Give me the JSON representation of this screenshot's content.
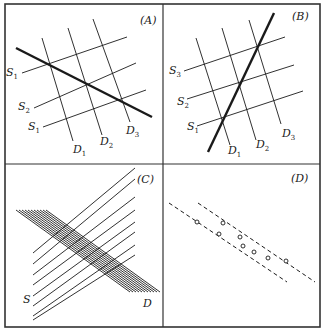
{
  "figure": {
    "border_color": "#333333",
    "line_color": "#1a1a1a",
    "outer": {
      "x": 5,
      "y": 4,
      "w": 315,
      "h": 323
    },
    "divider": {
      "x": 163,
      "y": 164
    }
  },
  "panels": [
    {
      "id": "A",
      "label": "(A)",
      "label_pos": [
        140,
        24
      ],
      "supply_lines": [
        {
          "name": "S",
          "sub": "1",
          "from": [
            22,
            73
          ],
          "to": [
            127,
            37
          ],
          "label_pos": [
            6,
            76
          ]
        },
        {
          "name": "S",
          "sub": "2",
          "from": [
            34,
            108
          ],
          "to": [
            136,
            63
          ],
          "label_pos": [
            18,
            110
          ]
        },
        {
          "name": "S",
          "sub": "1",
          "from": [
            43,
            127
          ],
          "to": [
            146,
            90
          ],
          "label_pos": [
            28,
            130
          ]
        }
      ],
      "demand_lines": [
        {
          "name": "D",
          "sub": "1",
          "from": [
            42,
            38
          ],
          "to": [
            73,
            141
          ],
          "label_pos": [
            73,
            153
          ]
        },
        {
          "name": "D",
          "sub": "2",
          "from": [
            68,
            28
          ],
          "to": [
            102,
            135
          ],
          "label_pos": [
            100,
            145
          ]
        },
        {
          "name": "D",
          "sub": "3",
          "from": [
            93,
            19
          ],
          "to": [
            130,
            122
          ],
          "label_pos": [
            126,
            134
          ]
        }
      ],
      "bold_line": {
        "from": [
          16,
          48
        ],
        "to": [
          152,
          117
        ]
      }
    },
    {
      "id": "B",
      "label": "(B)",
      "label_pos": [
        292,
        20
      ],
      "supply_lines": [
        {
          "name": "S",
          "sub": "3",
          "from": [
            184,
            71
          ],
          "to": [
            285,
            37
          ],
          "label_pos": [
            169,
            74
          ]
        },
        {
          "name": "S",
          "sub": "2",
          "from": [
            187,
            99
          ],
          "to": [
            294,
            65
          ],
          "label_pos": [
            177,
            105
          ]
        },
        {
          "name": "S",
          "sub": "1",
          "from": [
            197,
            126
          ],
          "to": [
            303,
            91
          ],
          "label_pos": [
            187,
            130
          ]
        }
      ],
      "demand_lines": [
        {
          "name": "D",
          "sub": "1",
          "from": [
            196,
            38
          ],
          "to": [
            230,
            145
          ],
          "label_pos": [
            228,
            154
          ]
        },
        {
          "name": "D",
          "sub": "2",
          "from": [
            222,
            28
          ],
          "to": [
            256,
            140
          ],
          "label_pos": [
            256,
            148
          ]
        },
        {
          "name": "D",
          "sub": "3",
          "from": [
            249,
            20
          ],
          "to": [
            281,
            124
          ],
          "label_pos": [
            282,
            137
          ]
        }
      ],
      "bold_line": {
        "from": [
          208,
          152
        ],
        "to": [
          274,
          13
        ]
      }
    },
    {
      "id": "C",
      "label": "(C)",
      "label_pos": [
        137,
        183
      ],
      "supply_label": "S",
      "supply_label_pos": [
        23,
        303
      ],
      "demand_label": "D",
      "demand_label_pos": [
        143,
        307
      ],
      "supply_lines": [
        {
          "from": [
            33,
            253
          ],
          "to": [
            135,
            168
          ]
        },
        {
          "from": [
            33,
            264
          ],
          "to": [
            135,
            179
          ]
        },
        {
          "from": [
            33,
            275
          ],
          "to": [
            135,
            197
          ]
        },
        {
          "from": [
            33,
            285
          ],
          "to": [
            135,
            210
          ]
        },
        {
          "from": [
            33,
            296
          ],
          "to": [
            135,
            222
          ]
        },
        {
          "from": [
            33,
            306
          ],
          "to": [
            135,
            232
          ]
        },
        {
          "from": [
            33,
            316
          ],
          "to": [
            135,
            245
          ]
        },
        {
          "from": [
            33,
            320
          ],
          "to": [
            135,
            255
          ]
        }
      ],
      "demand_lines": [
        {
          "from": [
            16,
            210
          ],
          "to": [
            130,
            292
          ]
        },
        {
          "from": [
            19,
            210
          ],
          "to": [
            133,
            292
          ]
        },
        {
          "from": [
            22,
            210
          ],
          "to": [
            136,
            292
          ]
        },
        {
          "from": [
            25,
            210
          ],
          "to": [
            139,
            292
          ]
        },
        {
          "from": [
            28,
            210
          ],
          "to": [
            142,
            292
          ]
        },
        {
          "from": [
            31,
            210
          ],
          "to": [
            145,
            292
          ]
        },
        {
          "from": [
            34,
            210
          ],
          "to": [
            148,
            292
          ]
        },
        {
          "from": [
            37,
            210
          ],
          "to": [
            151,
            292
          ]
        },
        {
          "from": [
            40,
            210
          ],
          "to": [
            154,
            292
          ]
        },
        {
          "from": [
            43,
            210
          ],
          "to": [
            157,
            292
          ]
        },
        {
          "from": [
            46,
            210
          ],
          "to": [
            160,
            292
          ]
        }
      ]
    },
    {
      "id": "D",
      "label": "(D)",
      "label_pos": [
        291,
        182
      ],
      "dashed_lines": [
        {
          "from": [
            169,
            203
          ],
          "to": [
            287,
            282
          ]
        },
        {
          "from": [
            198,
            203
          ],
          "to": [
            315,
            282
          ]
        }
      ],
      "points": [
        [
          197,
          222
        ],
        [
          223,
          223
        ],
        [
          219,
          234
        ],
        [
          240,
          237
        ],
        [
          243,
          246
        ],
        [
          254,
          252
        ],
        [
          268,
          258
        ],
        [
          286,
          261
        ]
      ]
    }
  ]
}
